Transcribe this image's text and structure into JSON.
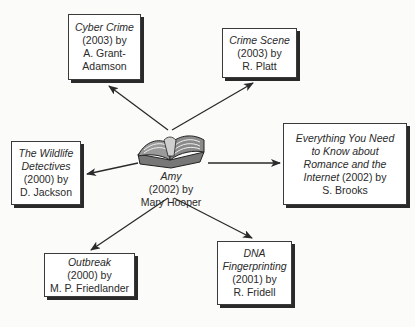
{
  "diagram": {
    "type": "book-relationship-web",
    "center": {
      "icon": "open-book-icon",
      "title": "Amy",
      "year_author_line1": "(2002) by",
      "author": "Mary Hooper"
    },
    "nodes": [
      {
        "id": "cyber-crime",
        "title_lines": [
          "Cyber Crime"
        ],
        "info_lines": [
          "(2003) by",
          "A. Grant-",
          "Adamson"
        ]
      },
      {
        "id": "crime-scene",
        "title_lines": [
          "Crime Scene"
        ],
        "info_lines": [
          "(2003) by",
          "R. Platt"
        ]
      },
      {
        "id": "wildlife-detectives",
        "title_lines": [
          "The Wildlife",
          "Detectives"
        ],
        "info_lines": [
          "(2000) by",
          "D. Jackson"
        ]
      },
      {
        "id": "everything-you-need",
        "title_lines": [
          "Everything You Need",
          "to Know about",
          "Romance and the",
          "Internet"
        ],
        "info_inline": " (2002) by",
        "info_lines": [
          "S. Brooks"
        ]
      },
      {
        "id": "outbreak",
        "title_lines": [
          "Outbreak"
        ],
        "info_lines": [
          "(2000) by",
          "M. P. Friedlander"
        ]
      },
      {
        "id": "dna-fingerprinting",
        "title_lines": [
          "DNA",
          "Fingerprinting"
        ],
        "info_lines": [
          "(2001) by",
          "R. Fridell"
        ]
      }
    ],
    "edges": [
      {
        "from": "center",
        "to": "cyber-crime",
        "arrow": "to"
      },
      {
        "from": "center",
        "to": "crime-scene",
        "arrow": "to"
      },
      {
        "from": "center",
        "to": "wildlife-detectives",
        "arrow": "to"
      },
      {
        "from": "center",
        "to": "everything-you-need",
        "arrow": "to"
      },
      {
        "from": "center",
        "to": "outbreak",
        "arrow": "to"
      },
      {
        "from": "center",
        "to": "dna-fingerprinting",
        "arrow": "to"
      }
    ],
    "colors": {
      "line": "#2a2a2a",
      "box_border": "#3a3a3a",
      "background": "#fbfbf9"
    }
  }
}
